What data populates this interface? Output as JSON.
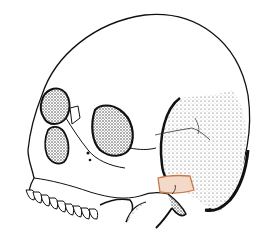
{
  "image": {
    "subject": "skull-illustration-lateral-oblique-view",
    "colors": {
      "background": "#ffffff",
      "ink": "#111111",
      "highlight_fill": "#f3d9c8",
      "highlight_stroke": "#c8784a"
    }
  }
}
